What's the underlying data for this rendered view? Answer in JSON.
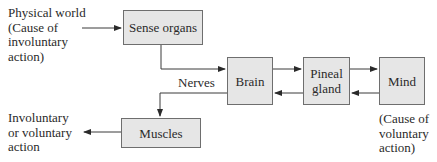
{
  "diagram": {
    "nodes": {
      "sense_organs": "Sense organs",
      "brain": "Brain",
      "pineal_gland": "Pineal\ngland",
      "mind": "Mind",
      "muscles": "Muscles"
    },
    "labels": {
      "physical_world": "Physical world\n(Cause of\ninvoluntary\naction)",
      "nerves": "Nerves",
      "action_output": "Involuntary\nor voluntary\naction",
      "mind_cause": "(Cause of\nvoluntary\naction)"
    },
    "edges": [
      {
        "from": "physical_world",
        "to": "sense_organs"
      },
      {
        "from": "sense_organs",
        "to": "brain",
        "label": "Nerves"
      },
      {
        "from": "brain",
        "to": "pineal_gland"
      },
      {
        "from": "pineal_gland",
        "to": "mind"
      },
      {
        "from": "mind",
        "to": "pineal_gland"
      },
      {
        "from": "pineal_gland",
        "to": "brain"
      },
      {
        "from": "brain",
        "to": "muscles"
      },
      {
        "from": "muscles",
        "to": "action_output"
      }
    ],
    "colors": {
      "box_fill": "#e6e6e6",
      "box_border": "#6e6e6e",
      "line": "#3a3a3a"
    }
  }
}
